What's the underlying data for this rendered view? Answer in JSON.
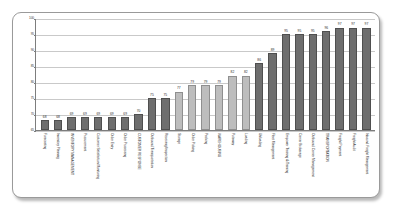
{
  "chart_data": {
    "type": "bar",
    "title": "",
    "subtitle": "",
    "xlabel": "",
    "ylabel": "",
    "ylim": [
      65,
      100
    ],
    "yticks": [
      65,
      70,
      75,
      80,
      85,
      90,
      95,
      100
    ],
    "grid": true,
    "legend": "none",
    "categories": [
      "Forecasting",
      "Inventory Planning",
      "INVENTORY MANAGEMENT",
      "Procurement",
      "Customer Satisfaction Monitoring",
      "Order Entry",
      "Order Processing",
      "CUSTOMER RESPONSE",
      "Outbound Transportation",
      "Receiving/Inspection",
      "Storage",
      "Order Picking",
      "Packing",
      "WAREHOUSING",
      "Putaway",
      "Loading",
      "Unloading",
      "Fleet Management",
      "Empower Training & Training",
      "Carrier Brokerage",
      "Outbound Carrier Management",
      "TRANSPORTATION",
      "Freight Payment",
      "Freight Audit",
      "Inbound Freight Management"
    ],
    "values": [
      68,
      68,
      69,
      69,
      69,
      69,
      69,
      70,
      75,
      75,
      77,
      79,
      79,
      79,
      82,
      82,
      86,
      89,
      95,
      95,
      95,
      96,
      97,
      97,
      97
    ],
    "value_labels": [
      "68",
      "68",
      "69",
      "69",
      "69",
      "69",
      "69",
      "70",
      "75",
      "75",
      "77",
      "79",
      "79",
      "79",
      "82",
      "82",
      "86",
      "89",
      "95",
      "95",
      "95",
      "96",
      "97",
      "97",
      "97"
    ],
    "bar_styles": [
      "dark",
      "dark",
      "dark",
      "dark",
      "dark",
      "dark",
      "dark",
      "dark",
      "dark",
      "dark",
      "light",
      "light",
      "light",
      "light",
      "light",
      "light",
      "dark",
      "dark",
      "dark",
      "dark",
      "dark",
      "dark",
      "dark",
      "dark",
      "dark"
    ],
    "colors": {
      "bar_dark": "#6e6e6e",
      "bar_light": "#bdbdbd",
      "gridline": "#c9c9c9",
      "axis": "#7d7d7d",
      "text": "#2b2b2b",
      "frame_border": "#9a9a9a",
      "background": "#ffffff"
    }
  }
}
